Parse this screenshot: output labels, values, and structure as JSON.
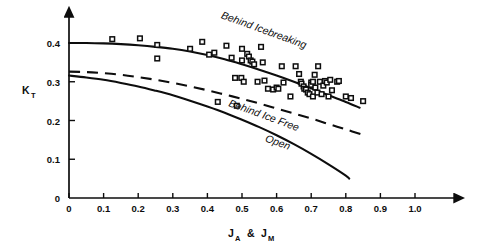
{
  "chart_data": {
    "type": "scatter",
    "title": "",
    "subtitle": "",
    "xlabel": "J_A & J_M",
    "xlabel_parts": [
      {
        "base": "J",
        "sub": "A"
      },
      {
        "base": "&",
        "sub": ""
      },
      {
        "base": "J",
        "sub": "M"
      }
    ],
    "ylabel": "K_T",
    "ylabel_parts": [
      {
        "base": "K",
        "sub": "T"
      }
    ],
    "xlim": [
      0,
      1.0
    ],
    "ylim": [
      0,
      0.44
    ],
    "grid": false,
    "legend_position": "inline-annotations",
    "xticks": [
      0,
      0.1,
      0.2,
      0.3,
      0.4,
      0.5,
      0.6,
      0.7,
      0.8,
      0.9,
      1.0
    ],
    "xticklabels": [
      "0",
      "0.1",
      "0.2",
      "0.3",
      "0.4",
      "0.5",
      "0.6",
      "0.7",
      "0.8",
      "0.9",
      "1.0"
    ],
    "yticks": [
      0,
      0.1,
      0.2,
      0.3,
      0.4
    ],
    "yticklabels": [
      "0",
      "0.1",
      "0.2",
      "0.3",
      "0.4"
    ],
    "annotations": [
      {
        "name": "behind-icebreaking-label",
        "text": "Behind Icebreaking",
        "x": 0.56,
        "y": 0.425,
        "rotation": 20
      },
      {
        "name": "behind-ice-free-label",
        "text": "Behind Ice Free",
        "x": 0.56,
        "y": 0.205,
        "rotation": 20
      },
      {
        "name": "open-label",
        "text": "Open",
        "x": 0.6,
        "y": 0.135,
        "rotation": 20
      }
    ],
    "series": [
      {
        "name": "Behind Icebreaking",
        "style": "solid",
        "type": "line",
        "points": [
          [
            0.0,
            0.4
          ],
          [
            0.05,
            0.4
          ],
          [
            0.1,
            0.399
          ],
          [
            0.15,
            0.397
          ],
          [
            0.2,
            0.394
          ],
          [
            0.25,
            0.39
          ],
          [
            0.3,
            0.385
          ],
          [
            0.35,
            0.378
          ],
          [
            0.4,
            0.369
          ],
          [
            0.45,
            0.358
          ],
          [
            0.5,
            0.345
          ],
          [
            0.55,
            0.331
          ],
          [
            0.6,
            0.316
          ],
          [
            0.65,
            0.3
          ],
          [
            0.7,
            0.283
          ],
          [
            0.75,
            0.265
          ],
          [
            0.8,
            0.248
          ],
          [
            0.84,
            0.233
          ]
        ]
      },
      {
        "name": "Behind Ice Free",
        "style": "dashed",
        "type": "line",
        "points": [
          [
            0.0,
            0.326
          ],
          [
            0.05,
            0.325
          ],
          [
            0.1,
            0.322
          ],
          [
            0.15,
            0.318
          ],
          [
            0.2,
            0.312
          ],
          [
            0.25,
            0.305
          ],
          [
            0.3,
            0.297
          ],
          [
            0.35,
            0.288
          ],
          [
            0.4,
            0.278
          ],
          [
            0.45,
            0.267
          ],
          [
            0.5,
            0.256
          ],
          [
            0.55,
            0.244
          ],
          [
            0.6,
            0.231
          ],
          [
            0.65,
            0.218
          ],
          [
            0.7,
            0.205
          ],
          [
            0.75,
            0.191
          ],
          [
            0.8,
            0.177
          ],
          [
            0.85,
            0.163
          ]
        ]
      },
      {
        "name": "Open",
        "style": "solid",
        "type": "line",
        "points": [
          [
            0.0,
            0.316
          ],
          [
            0.05,
            0.311
          ],
          [
            0.1,
            0.305
          ],
          [
            0.15,
            0.297
          ],
          [
            0.2,
            0.288
          ],
          [
            0.25,
            0.277
          ],
          [
            0.3,
            0.265
          ],
          [
            0.35,
            0.251
          ],
          [
            0.4,
            0.236
          ],
          [
            0.45,
            0.22
          ],
          [
            0.5,
            0.202
          ],
          [
            0.55,
            0.183
          ],
          [
            0.6,
            0.162
          ],
          [
            0.65,
            0.139
          ],
          [
            0.7,
            0.114
          ],
          [
            0.75,
            0.087
          ],
          [
            0.8,
            0.058
          ],
          [
            0.81,
            0.05
          ]
        ]
      }
    ],
    "scatter_points": {
      "name": "Measured data",
      "marker": "open-square",
      "values": [
        [
          0.125,
          0.41
        ],
        [
          0.205,
          0.412
        ],
        [
          0.255,
          0.395
        ],
        [
          0.255,
          0.36
        ],
        [
          0.35,
          0.385
        ],
        [
          0.385,
          0.403
        ],
        [
          0.405,
          0.37
        ],
        [
          0.42,
          0.375
        ],
        [
          0.455,
          0.393
        ],
        [
          0.47,
          0.362
        ],
        [
          0.48,
          0.31
        ],
        [
          0.498,
          0.31
        ],
        [
          0.5,
          0.385
        ],
        [
          0.5,
          0.355
        ],
        [
          0.505,
          0.3
        ],
        [
          0.515,
          0.372
        ],
        [
          0.52,
          0.365
        ],
        [
          0.525,
          0.355
        ],
        [
          0.53,
          0.352
        ],
        [
          0.535,
          0.345
        ],
        [
          0.545,
          0.3
        ],
        [
          0.555,
          0.39
        ],
        [
          0.56,
          0.35
        ],
        [
          0.565,
          0.303
        ],
        [
          0.575,
          0.282
        ],
        [
          0.59,
          0.28
        ],
        [
          0.6,
          0.285
        ],
        [
          0.605,
          0.282
        ],
        [
          0.615,
          0.34
        ],
        [
          0.62,
          0.298
        ],
        [
          0.64,
          0.262
        ],
        [
          0.655,
          0.34
        ],
        [
          0.665,
          0.32
        ],
        [
          0.67,
          0.3
        ],
        [
          0.672,
          0.295
        ],
        [
          0.678,
          0.288
        ],
        [
          0.68,
          0.282
        ],
        [
          0.685,
          0.28
        ],
        [
          0.69,
          0.272
        ],
        [
          0.695,
          0.268
        ],
        [
          0.7,
          0.298
        ],
        [
          0.7,
          0.292
        ],
        [
          0.705,
          0.3
        ],
        [
          0.705,
          0.262
        ],
        [
          0.71,
          0.318
        ],
        [
          0.712,
          0.285
        ],
        [
          0.718,
          0.272
        ],
        [
          0.72,
          0.34
        ],
        [
          0.725,
          0.3
        ],
        [
          0.73,
          0.268
        ],
        [
          0.735,
          0.29
        ],
        [
          0.74,
          0.302
        ],
        [
          0.745,
          0.298
        ],
        [
          0.75,
          0.262
        ],
        [
          0.755,
          0.305
        ],
        [
          0.76,
          0.278
        ],
        [
          0.775,
          0.3
        ],
        [
          0.78,
          0.302
        ],
        [
          0.8,
          0.262
        ],
        [
          0.815,
          0.258
        ],
        [
          0.85,
          0.25
        ],
        [
          0.43,
          0.248
        ],
        [
          0.485,
          0.238
        ]
      ]
    }
  }
}
